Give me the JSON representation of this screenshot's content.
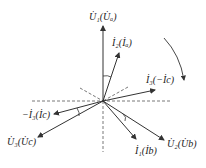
{
  "diagram": {
    "type": "phasor-diagram",
    "colors": {
      "line": "#333333",
      "dash": "#555555"
    },
    "labels": {
      "U1": "U̇₁(U̇ₐ)",
      "I2": "İ₂(İₐ)",
      "I3": "İ₃(−İc)",
      "negI3": "−İ₃(İc)",
      "U3": "U̇₃(U̇c)",
      "I1": "İ₁(İb)",
      "U2": "U̇₂(U̇b)"
    },
    "rotation_direction": "clockwise"
  }
}
